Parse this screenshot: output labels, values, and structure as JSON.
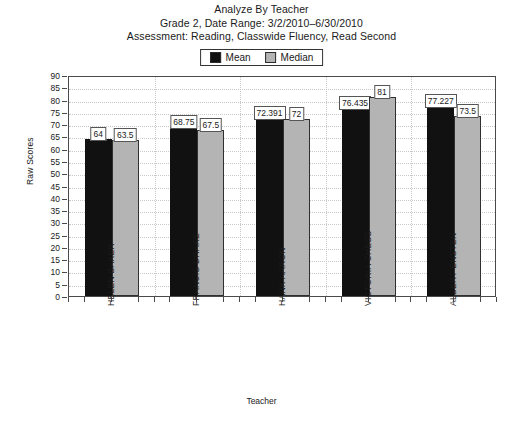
{
  "title": {
    "line1": "Analyze By Teacher",
    "line2": "Grade 2, Date Range: 3/2/2010–6/30/2010",
    "line3": "Assessment: Reading, Classwide Fluency, Read Second"
  },
  "legend": {
    "mean_label": "Mean",
    "median_label": "Median",
    "mean_color": "#111111",
    "median_color": "#b4b4b4"
  },
  "axes": {
    "y_title": "Raw Scores",
    "x_title": "Teacher"
  },
  "chart_data": {
    "type": "bar",
    "title": "Analyze By Teacher",
    "subtitle": "Grade 2, Date Range: 3/2/2010–6/30/2010 | Assessment: Reading, Classwide Fluency, Read Second",
    "xlabel": "Teacher",
    "ylabel": "Raw Scores",
    "ylim": [
      0,
      90
    ],
    "ytick_step": 5,
    "yticks": [
      0,
      5,
      10,
      15,
      20,
      25,
      30,
      35,
      40,
      45,
      50,
      55,
      60,
      65,
      70,
      75,
      80,
      85,
      90
    ],
    "grid": true,
    "legend_position": "top-center",
    "categories": [
      "HELEN BAKER",
      "FRANCIS DRAKE",
      "HANK AARON",
      "VICTORIA CHESS",
      "ALBERT ENSTEN"
    ],
    "series": [
      {
        "name": "Mean",
        "color": "#111111",
        "values": [
          64,
          68.75,
          72.391,
          76.435,
          77.227
        ],
        "labels": [
          "64",
          "68.75",
          "72.391",
          "76.435",
          "77.227"
        ]
      },
      {
        "name": "Median",
        "color": "#b4b4b4",
        "values": [
          63.5,
          67.5,
          72,
          81,
          73.5
        ],
        "labels": [
          "63.5",
          "67.5",
          "72",
          "81",
          "73.5"
        ]
      }
    ]
  }
}
